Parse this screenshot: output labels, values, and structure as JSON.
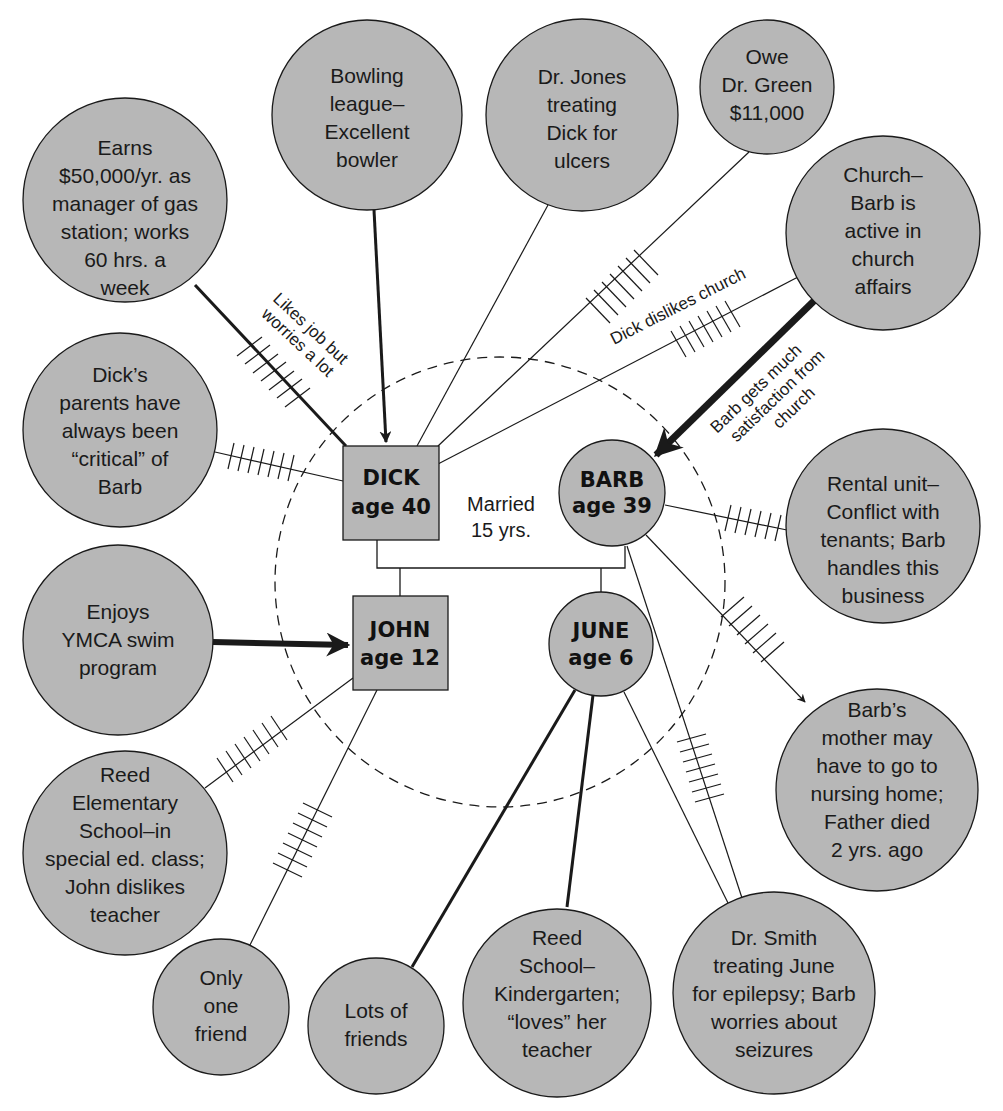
{
  "colors": {
    "node_fill": "#b7b7b7",
    "stroke": "#1a1a1a",
    "background": "#ffffff"
  },
  "family": {
    "dick": {
      "name": "DICK",
      "age": "age 40"
    },
    "barb": {
      "name": "BARB",
      "age": "age 39"
    },
    "john": {
      "name": "JOHN",
      "age": "age 12"
    },
    "june": {
      "name": "JUNE",
      "age": "age 6"
    },
    "married": {
      "line1": "Married",
      "line2": "15 yrs."
    }
  },
  "nodes": {
    "earns": [
      "Earns",
      "$50,000/yr. as",
      "manager of gas",
      "station; works",
      "60 hrs. a",
      "week"
    ],
    "bowling": [
      "Bowling",
      "league–",
      "Excellent",
      "bowler"
    ],
    "drjones": [
      "Dr. Jones",
      "treating",
      "Dick for",
      "ulcers"
    ],
    "drgreen": [
      "Owe",
      "Dr. Green",
      "$11,000"
    ],
    "church": [
      "Church–",
      "Barb is",
      "active in",
      "church",
      "affairs"
    ],
    "parents": [
      "Dick’s",
      "parents have",
      "always been",
      "“critical” of",
      "Barb"
    ],
    "rental": [
      "Rental unit–",
      "Conflict with",
      "tenants; Barb",
      "handles this",
      "business"
    ],
    "ymca": [
      "Enjoys",
      "YMCA swim",
      "program"
    ],
    "mother": [
      "Barb’s",
      "mother may",
      "have to go to",
      "nursing home;",
      "Father died",
      "2 yrs. ago"
    ],
    "reedelem": [
      "Reed",
      "Elementary",
      "School–in",
      "special ed. class;",
      "John dislikes",
      "teacher"
    ],
    "onefriend": [
      "Only",
      "one",
      "friend"
    ],
    "lotsfriends": [
      "Lots of",
      "friends"
    ],
    "kinder": [
      "Reed",
      "School–",
      "Kindergarten;",
      "“loves” her",
      "teacher"
    ],
    "drsmith": [
      "Dr. Smith",
      "treating June",
      "for epilepsy; Barb",
      "worries about",
      "seizures"
    ]
  },
  "edge_labels": {
    "job": [
      "Likes job but",
      "worries a lot"
    ],
    "dick_church": "Dick dislikes church",
    "barb_church": [
      "Barb gets much",
      "satisfaction from",
      "church"
    ]
  }
}
